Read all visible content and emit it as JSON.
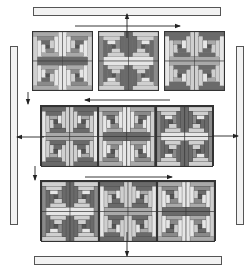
{
  "diagram": {
    "title": "",
    "colors": {
      "dark": "#6a6a6a",
      "mid_dark": "#8a8a8a",
      "mid": "#a9a9a9",
      "light": "#cfcfcf",
      "very_light": "#e6e6e6",
      "center": "#555555",
      "outline": "#333333",
      "strip_fill": "#f2f2f2",
      "arrow": "#222222"
    },
    "strips": [
      {
        "name": "top-border-strip",
        "x": 33,
        "y": 7,
        "w": 188,
        "h": 9
      },
      {
        "name": "bottom-border-strip",
        "x": 34,
        "y": 256,
        "w": 188,
        "h": 9
      },
      {
        "name": "left-border-strip",
        "x": 10,
        "y": 46,
        "w": 8,
        "h": 179
      },
      {
        "name": "right-border-strip",
        "x": 236,
        "y": 46,
        "w": 8,
        "h": 179
      }
    ],
    "rows": [
      {
        "name": "row-1",
        "x": 32,
        "y": 31,
        "w": 193,
        "h": 60,
        "separated": true,
        "blocks": [
          {
            "name": "block-r1-c1",
            "pattern": "A"
          },
          {
            "name": "block-r1-c2",
            "pattern": "B"
          },
          {
            "name": "block-r1-c3",
            "pattern": "C"
          }
        ]
      },
      {
        "name": "row-2",
        "x": 40,
        "y": 105,
        "w": 174,
        "h": 61,
        "separated": false,
        "blocks": [
          {
            "name": "block-r2-c1",
            "pattern": "C"
          },
          {
            "name": "block-r2-c2",
            "pattern": "A"
          },
          {
            "name": "block-r2-c3",
            "pattern": "B"
          }
        ]
      },
      {
        "name": "row-3",
        "x": 40,
        "y": 180,
        "w": 176,
        "h": 61,
        "separated": false,
        "blocks": [
          {
            "name": "block-r3-c1",
            "pattern": "B"
          },
          {
            "name": "block-r3-c2",
            "pattern": "C"
          },
          {
            "name": "block-r3-c3",
            "pattern": "A"
          }
        ]
      }
    ],
    "patterns": {
      "A": [
        "mid",
        "very_light",
        "dark",
        "light",
        "mid_dark",
        "very_light",
        "center"
      ],
      "B": [
        "light",
        "dark",
        "very_light",
        "mid_dark",
        "light",
        "dark",
        "center"
      ],
      "C": [
        "dark",
        "light",
        "mid",
        "very_light",
        "dark",
        "light",
        "center"
      ]
    },
    "arrows": [
      {
        "name": "arrow-top-strip-down",
        "x1": 127,
        "y1": 14,
        "x2": 127,
        "y2": 38,
        "head": "up"
      },
      {
        "name": "arrow-row1-right",
        "x1": 75,
        "y1": 26,
        "x2": 180,
        "y2": 26,
        "head": "end"
      },
      {
        "name": "arrow-row2-left",
        "x1": 170,
        "y1": 100,
        "x2": 85,
        "y2": 100,
        "head": "end"
      },
      {
        "name": "arrow-row3-right",
        "x1": 85,
        "y1": 177,
        "x2": 172,
        "y2": 177,
        "head": "end"
      },
      {
        "name": "arrow-left-strip",
        "x1": 44,
        "y1": 137,
        "x2": 17,
        "y2": 137,
        "head": "end"
      },
      {
        "name": "arrow-right-strip",
        "x1": 212,
        "y1": 136,
        "x2": 238,
        "y2": 136,
        "head": "end"
      },
      {
        "name": "arrow-left-down-1",
        "x1": 28,
        "y1": 92,
        "x2": 28,
        "y2": 104,
        "head": "end"
      },
      {
        "name": "arrow-left-down-2",
        "x1": 35,
        "y1": 166,
        "x2": 35,
        "y2": 180,
        "head": "end"
      },
      {
        "name": "arrow-bottom-strip",
        "x1": 127,
        "y1": 232,
        "x2": 127,
        "y2": 256,
        "head": "end"
      }
    ]
  }
}
